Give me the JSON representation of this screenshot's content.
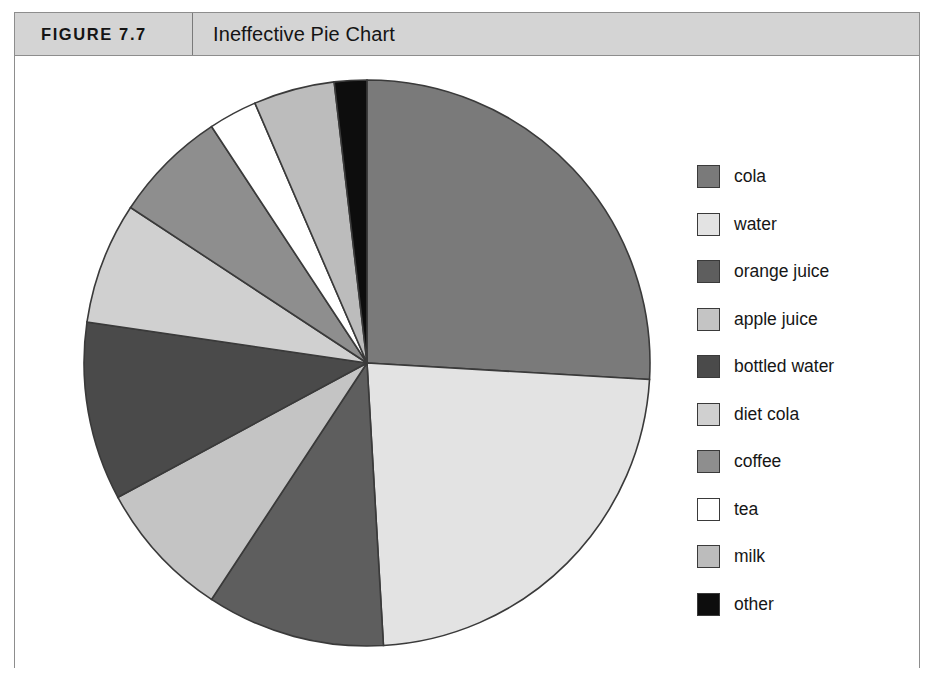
{
  "figure": {
    "number_label": "FIGURE 7.7",
    "title": "Ineffective Pie Chart"
  },
  "legend": {
    "position": "right",
    "items": [
      {
        "label": "cola",
        "color": "#7a7a7a"
      },
      {
        "label": "water",
        "color": "#e3e3e3"
      },
      {
        "label": "orange juice",
        "color": "#5e5e5e"
      },
      {
        "label": "apple juice",
        "color": "#c4c4c4"
      },
      {
        "label": "bottled water",
        "color": "#4a4a4a"
      },
      {
        "label": "diet cola",
        "color": "#d0d0d0"
      },
      {
        "label": "coffee",
        "color": "#8e8e8e"
      },
      {
        "label": "tea",
        "color": "#ffffff"
      },
      {
        "label": "milk",
        "color": "#bcbcbc"
      },
      {
        "label": "other",
        "color": "#0d0d0d"
      }
    ]
  },
  "chart_data": {
    "type": "pie",
    "title": "Ineffective Pie Chart",
    "xlabel": "",
    "ylabel": "",
    "start_angle_deg": 0,
    "direction": "clockwise",
    "slice_outline_color": "#3a3a3a",
    "categories": [
      "cola",
      "water",
      "orange juice",
      "apple juice",
      "bottled water",
      "diet cola",
      "coffee",
      "tea",
      "milk",
      "other"
    ],
    "values": [
      28.0,
      25.0,
      11.0,
      8.5,
      11.0,
      7.5,
      7.0,
      3.0,
      5.0,
      2.0
    ],
    "units": "percent",
    "angles_deg": [
      100.8,
      90.0,
      39.6,
      30.6,
      39.6,
      27.0,
      25.2,
      10.8,
      18.0,
      7.2
    ],
    "colors": [
      "#7a7a7a",
      "#e3e3e3",
      "#5e5e5e",
      "#c4c4c4",
      "#4a4a4a",
      "#d0d0d0",
      "#8e8e8e",
      "#ffffff",
      "#bcbcbc",
      "#0d0d0d"
    ],
    "legend_position": "right",
    "grid": false,
    "data_labels_shown": false
  }
}
